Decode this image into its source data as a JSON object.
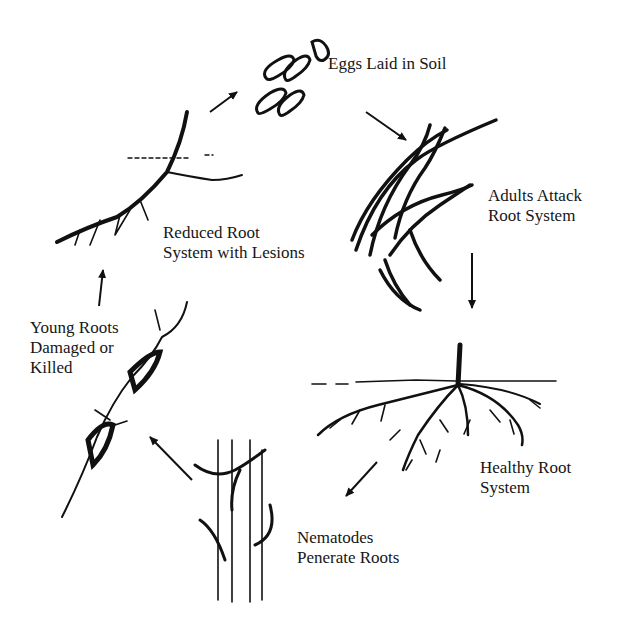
{
  "diagram": {
    "type": "cycle",
    "stages": [
      {
        "id": "eggs",
        "lines": [
          "Eggs Laid in Soil"
        ]
      },
      {
        "id": "adults",
        "lines": [
          "Adults Attack",
          "Root System"
        ]
      },
      {
        "id": "healthy",
        "lines": [
          "Healthy Root",
          "System"
        ]
      },
      {
        "id": "penetrate",
        "lines": [
          "Nematodes",
          "Penerate Roots"
        ]
      },
      {
        "id": "young",
        "lines": [
          "Young Roots",
          "Damaged or",
          "Killed"
        ]
      },
      {
        "id": "reduced",
        "lines": [
          "Reduced Root",
          "System with Lesions"
        ]
      }
    ],
    "flow": [
      "eggs",
      "adults",
      "healthy",
      "penetrate",
      "young",
      "reduced",
      "eggs"
    ],
    "colors": {
      "ink": "#111111",
      "background": "#ffffff"
    }
  }
}
